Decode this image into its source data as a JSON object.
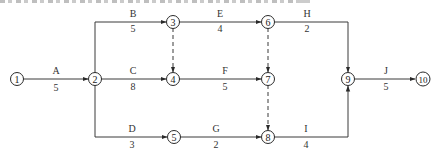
{
  "diagram": {
    "type": "activity-on-arrow network",
    "nodes": [
      {
        "id": "1",
        "label": "1",
        "x": 17,
        "y": 79
      },
      {
        "id": "2",
        "label": "2",
        "x": 95,
        "y": 79
      },
      {
        "id": "3",
        "label": "3",
        "x": 173,
        "y": 22
      },
      {
        "id": "4",
        "label": "4",
        "x": 173,
        "y": 79
      },
      {
        "id": "5",
        "label": "5",
        "x": 174,
        "y": 137
      },
      {
        "id": "6",
        "label": "6",
        "x": 268,
        "y": 22
      },
      {
        "id": "7",
        "label": "7",
        "x": 268,
        "y": 79
      },
      {
        "id": "8",
        "label": "8",
        "x": 268,
        "y": 137
      },
      {
        "id": "9",
        "label": "9",
        "x": 348,
        "y": 79
      },
      {
        "id": "10",
        "label": "10",
        "x": 423,
        "y": 79
      }
    ],
    "activities": [
      {
        "name": "A",
        "duration": "5",
        "from": "1",
        "to": "2"
      },
      {
        "name": "B",
        "duration": "5",
        "from": "2",
        "to": "3"
      },
      {
        "name": "C",
        "duration": "8",
        "from": "2",
        "to": "4"
      },
      {
        "name": "D",
        "duration": "3",
        "from": "2",
        "to": "5"
      },
      {
        "name": "E",
        "duration": "4",
        "from": "3",
        "to": "6"
      },
      {
        "name": "F",
        "duration": "5",
        "from": "4",
        "to": "7"
      },
      {
        "name": "G",
        "duration": "2",
        "from": "5",
        "to": "8"
      },
      {
        "name": "H",
        "duration": "2",
        "from": "6",
        "to": "9"
      },
      {
        "name": "I",
        "duration": "4",
        "from": "8",
        "to": "9"
      },
      {
        "name": "J",
        "duration": "5",
        "from": "9",
        "to": "10"
      }
    ],
    "dummy_activities": [
      {
        "from": "3",
        "to": "4"
      },
      {
        "from": "6",
        "to": "7"
      },
      {
        "from": "7",
        "to": "8"
      }
    ]
  }
}
